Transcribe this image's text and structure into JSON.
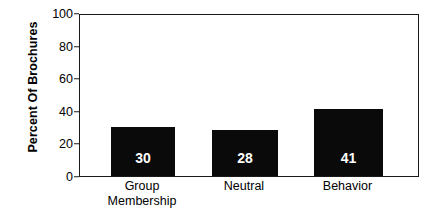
{
  "chart_data": {
    "type": "bar",
    "title": "",
    "subtitle": "",
    "xlabel": "",
    "ylabel": "Percent Of Brochures",
    "categories": [
      "Group Membership",
      "Neutral",
      "Behavior"
    ],
    "category_lines": [
      [
        "Group",
        "Membership"
      ],
      [
        "Neutral"
      ],
      [
        "Behavior"
      ]
    ],
    "values": [
      30,
      28,
      41
    ],
    "value_labels": [
      "30",
      "28",
      "41"
    ],
    "ylim": [
      0,
      100
    ],
    "yticks": [
      0,
      20,
      40,
      60,
      80,
      100
    ],
    "ytick_labels": [
      "0",
      "20",
      "40",
      "60",
      "80",
      "100"
    ],
    "grid": false,
    "legend": false,
    "legend_position": "none",
    "bar_color": "#0a0a0a",
    "value_label_color": "#ffffff",
    "axis_color": "#1a1a1a",
    "background_color": "#ffffff"
  }
}
